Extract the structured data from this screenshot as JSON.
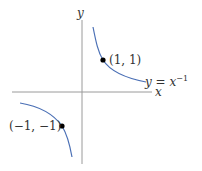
{
  "diagram": {
    "type": "function-plot",
    "function_label": "y = x^-1",
    "function_label_parts": {
      "lhs": "y",
      "eq": " = ",
      "base": "x",
      "exp": "−1"
    },
    "axes": {
      "x_label": "x",
      "y_label": "y"
    },
    "points": [
      {
        "label": "(1, 1)",
        "x": 1,
        "y": 1
      },
      {
        "label": "(−1, −1)",
        "x": -1,
        "y": -1
      }
    ],
    "colors": {
      "curve": "#4a6fb5",
      "axis": "#999999",
      "point": "#000000",
      "text": "#333333"
    }
  }
}
